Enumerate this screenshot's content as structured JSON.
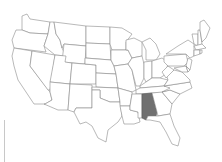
{
  "map": {
    "subject": "United States (contiguous) state outline map",
    "highlighted_state": "Alabama",
    "colors": {
      "background": "#ffffff",
      "state_fill": "#ffffff",
      "state_stroke": "#8a8a8a",
      "highlight_fill": "#707070"
    },
    "states": [
      {
        "name": "Washington",
        "d": "M22,16 L27,14 L30,19 L50,22 L48,34 L30,33 L22,30 Z"
      },
      {
        "name": "Oregon",
        "d": "M16,30 L22,30 L30,33 L48,34 L44,46 L46,52 L14,48 L12,40 Z"
      },
      {
        "name": "California",
        "d": "M14,48 L32,51 L30,66 L50,92 L52,100 L45,104 L34,104 L26,92 L18,80 L14,66 L12,56 Z"
      },
      {
        "name": "Nevada",
        "d": "M32,51 L55,55 L50,90 L48,90 L30,66 Z"
      },
      {
        "name": "Idaho",
        "d": "M50,22 L54,22 L56,34 L60,40 L62,48 L66,56 L55,55 L44,46 L48,34 Z"
      },
      {
        "name": "Montana",
        "d": "M54,22 L86,26 L86,46 L64,44 L62,48 L60,40 L56,34 Z"
      },
      {
        "name": "Wyoming",
        "d": "M64,44 L86,46 L85,64 L62,62 Z"
      },
      {
        "name": "Utah",
        "d": "M55,55 L66,56 L65,62 L72,63 L70,84 L50,82 Z"
      },
      {
        "name": "Arizona",
        "d": "M50,82 L70,84 L68,110 L58,110 L44,104 L45,104 L52,100 L50,92 Z"
      },
      {
        "name": "Colorado",
        "d": "M72,63 L96,65 L96,84 L70,84 Z"
      },
      {
        "name": "New Mexico",
        "d": "M70,84 L92,85 L92,108 L76,108 L74,112 L68,110 Z"
      },
      {
        "name": "North Dakota",
        "d": "M86,26 L110,27 L110,44 L86,43 Z"
      },
      {
        "name": "South Dakota",
        "d": "M86,43 L110,44 L111,60 L86,58 Z"
      },
      {
        "name": "Nebraska",
        "d": "M85,58 L111,60 L114,66 L116,74 L96,73 L96,65 L85,64 Z"
      },
      {
        "name": "Kansas",
        "d": "M96,73 L116,74 L118,88 L96,87 Z"
      },
      {
        "name": "Oklahoma",
        "d": "M92,87 L118,88 L120,102 L110,102 L100,98 L100,90 L92,90 Z"
      },
      {
        "name": "Texas",
        "d": "M92,90 L100,90 L100,98 L110,102 L120,102 L122,116 L118,122 L108,130 L106,142 L98,138 L92,126 L86,122 L80,124 L74,112 L76,108 L92,108 Z"
      },
      {
        "name": "Minnesota",
        "d": "M110,27 L122,28 L132,34 L126,42 L126,50 L112,50 L110,44 Z"
      },
      {
        "name": "Iowa",
        "d": "M111,50 L128,50 L132,58 L128,64 L114,66 L111,60 Z"
      },
      {
        "name": "Missouri",
        "d": "M114,66 L128,64 L132,70 L134,80 L136,90 L132,92 L118,88 L116,74 Z"
      },
      {
        "name": "Arkansas",
        "d": "M118,88 L132,92 L132,94 L130,106 L120,106 L120,102 Z"
      },
      {
        "name": "Louisiana",
        "d": "M120,106 L130,106 L130,110 L138,112 L140,122 L134,124 L124,124 L122,116 Z"
      },
      {
        "name": "Wisconsin",
        "d": "M126,40 L134,38 L142,42 L142,56 L132,58 L128,50 L126,50 Z"
      },
      {
        "name": "Illinois",
        "d": "M132,58 L142,56 L144,64 L144,78 L140,86 L136,86 L132,70 L128,64 Z"
      },
      {
        "name": "Michigan",
        "d": "M142,42 L150,38 L156,44 L160,54 L156,60 L146,60 L146,50 Z"
      },
      {
        "name": "Indiana",
        "d": "M144,62 L152,61 L152,78 L146,82 L144,78 Z"
      },
      {
        "name": "Ohio",
        "d": "M152,61 L162,58 L168,62 L166,74 L160,78 L152,78 Z"
      },
      {
        "name": "Kentucky",
        "d": "M140,86 L146,82 L152,78 L160,78 L168,80 L164,86 L140,88 Z"
      },
      {
        "name": "Tennessee",
        "d": "M136,90 L140,88 L164,86 L174,86 L170,92 L136,94 Z"
      },
      {
        "name": "Mississippi",
        "d": "M132,94 L142,94 L142,118 L138,118 L138,112 L130,110 L130,106 Z"
      },
      {
        "name": "Alabama",
        "d": "M142,94 L152,93 L157,112 L156,116 L148,116 L146,120 L142,118 Z"
      },
      {
        "name": "Georgia",
        "d": "M152,93 L162,92 L172,104 L170,114 L158,116 L157,112 Z"
      },
      {
        "name": "Florida",
        "d": "M146,120 L148,116 L156,116 L158,116 L170,114 L174,126 L180,138 L178,146 L172,144 L166,132 L160,122 L150,120 Z"
      },
      {
        "name": "South Carolina",
        "d": "M162,92 L170,90 L180,94 L172,104 Z"
      },
      {
        "name": "North Carolina",
        "d": "M164,86 L190,82 L192,88 L180,94 L170,90 L162,92 L170,88 Z"
      },
      {
        "name": "Virginia",
        "d": "M166,74 L174,70 L182,72 L190,80 L190,82 L164,86 L168,80 Z"
      },
      {
        "name": "West Virginia",
        "d": "M162,72 L168,66 L174,70 L166,78 Z"
      },
      {
        "name": "Pennsylvania",
        "d": "M164,56 L186,54 L188,62 L184,66 L168,66 L164,62 Z"
      },
      {
        "name": "New York",
        "d": "M166,54 L178,46 L188,40 L194,44 L194,56 L190,58 L186,54 Z"
      },
      {
        "name": "New Jersey",
        "d": "M188,58 L192,60 L190,70 L186,66 Z"
      },
      {
        "name": "Maryland",
        "d": "M174,68 L186,66 L188,72 L182,72 Z"
      },
      {
        "name": "Delaware",
        "d": "M186,66 L190,70 L188,72 Z"
      },
      {
        "name": "Vermont",
        "d": "M192,34 L198,34 L198,46 L194,44 Z"
      },
      {
        "name": "New Hampshire",
        "d": "M198,30 L200,30 L202,44 L198,46 Z"
      },
      {
        "name": "Maine",
        "d": "M200,22 L204,20 L210,28 L206,38 L202,42 L200,30 Z"
      },
      {
        "name": "Massachusetts",
        "d": "M194,46 L202,44 L206,48 L196,50 Z"
      },
      {
        "name": "Connecticut",
        "d": "M194,50 L200,50 L200,54 L194,56 Z"
      },
      {
        "name": "Rhode Island",
        "d": "M200,50 L202,50 L202,53 L200,54 Z"
      }
    ]
  }
}
